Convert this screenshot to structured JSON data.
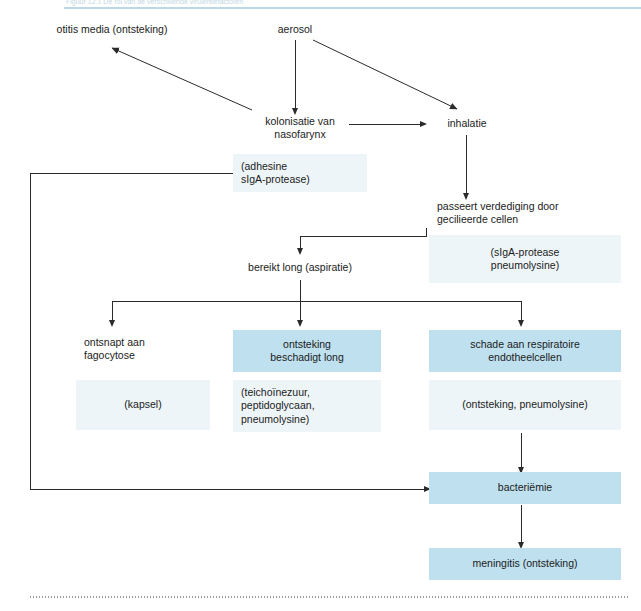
{
  "page": {
    "caption": "Figuur 12.1  De rol van de verschillende virulentiefactoren"
  },
  "diagram": {
    "colors": {
      "box_blue": "#bfe0ef",
      "box_pale": "#eef5f9",
      "line": "#2b2b2b",
      "rule": "#bcd7e6"
    },
    "nodes": [
      {
        "id": "otitis",
        "label": "otitis media (ontsteking)",
        "style": "plain"
      },
      {
        "id": "aerosol",
        "label": "aerosol",
        "style": "plain"
      },
      {
        "id": "kolonisatie",
        "label": "kolonisatie van\nnasofarynx",
        "style": "plain"
      },
      {
        "id": "inhalatie",
        "label": "inhalatie",
        "style": "plain"
      },
      {
        "id": "adhesine",
        "label": "(adhesine\nsIgA-protease)",
        "style": "pale"
      },
      {
        "id": "passeert",
        "label": "passeert verdediging door\ngecilieerde cellen",
        "style": "plain"
      },
      {
        "id": "siga",
        "label": "(sIgA-protease\npneumolysine)",
        "style": "pale"
      },
      {
        "id": "bereikt",
        "label": "bereikt long (aspiratie)",
        "style": "plain"
      },
      {
        "id": "ontsnapt",
        "label": "ontsnapt aan\nfagocytose",
        "style": "plain"
      },
      {
        "id": "ontsteking",
        "label": "ontsteking\nbeschadigt long",
        "style": "blue"
      },
      {
        "id": "schade",
        "label": "schade aan respiratoire\nendotheelcellen",
        "style": "blue"
      },
      {
        "id": "kapsel",
        "label": "(kapsel)",
        "style": "pale"
      },
      {
        "id": "teicho",
        "label": "(teichoïnezuur,\npeptidoglycaan,\npneumolysine)",
        "style": "pale"
      },
      {
        "id": "ontsteking2",
        "label": "(ontsteking, pneumolysine)",
        "style": "pale"
      },
      {
        "id": "bacteriemie",
        "label": "bacteriëmie",
        "style": "blue"
      },
      {
        "id": "meningitis",
        "label": "meningitis (ontsteking)",
        "style": "blue"
      }
    ],
    "edges": [
      {
        "from": "aerosol",
        "to": "otitis"
      },
      {
        "from": "aerosol",
        "to": "kolonisatie"
      },
      {
        "from": "aerosol",
        "to": "inhalatie"
      },
      {
        "from": "kolonisatie",
        "to": "otitis"
      },
      {
        "from": "kolonisatie",
        "to": "inhalatie"
      },
      {
        "from": "inhalatie",
        "to": "passeert"
      },
      {
        "from": "passeert",
        "to": "bereikt"
      },
      {
        "from": "bereikt",
        "to": "ontsnapt"
      },
      {
        "from": "bereikt",
        "to": "ontsteking"
      },
      {
        "from": "bereikt",
        "to": "schade"
      },
      {
        "from": "schade",
        "to": "bacteriemie"
      },
      {
        "from": "adhesine",
        "to": "bacteriemie"
      },
      {
        "from": "bacteriemie",
        "to": "meningitis"
      }
    ]
  }
}
